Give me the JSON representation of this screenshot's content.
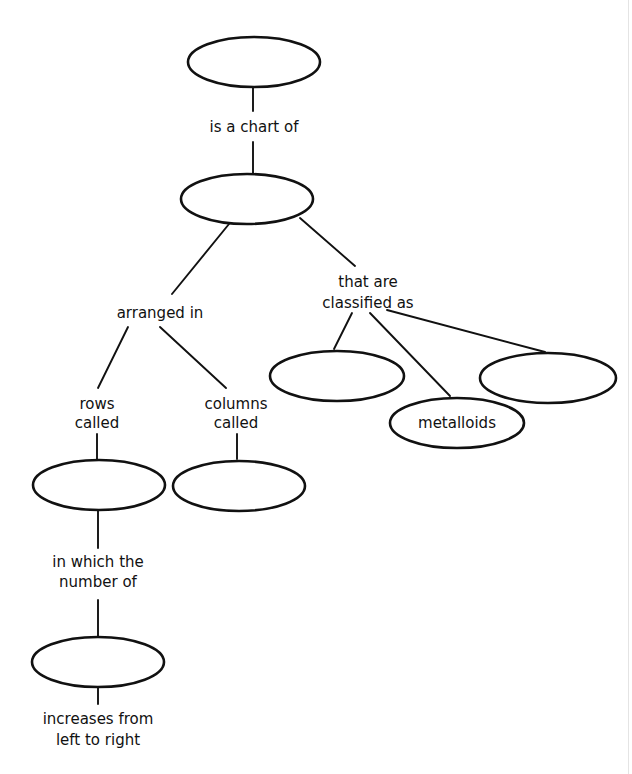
{
  "diagram": {
    "type": "concept-map",
    "nodes": {
      "root": {
        "label": ""
      },
      "periodic_table": {
        "label": ""
      },
      "class_left": {
        "label": ""
      },
      "metalloids": {
        "label": "metalloids"
      },
      "class_right": {
        "label": ""
      },
      "rows": {
        "label": ""
      },
      "columns": {
        "label": ""
      },
      "bottom": {
        "label": ""
      }
    },
    "linking_phrases": {
      "is_a_chart_of": "is a chart of",
      "arranged_in": "arranged in",
      "that_are_classified_as": [
        "that are",
        "classified as"
      ],
      "rows_called": [
        "rows",
        "called"
      ],
      "columns_called": [
        "columns",
        "called"
      ],
      "in_which_the_number_of": [
        "in which the",
        "number of"
      ],
      "increases_from_left_to_right": [
        "increases from",
        "left to right"
      ]
    },
    "colors": {
      "stroke": "#111111",
      "background": "#ffffff",
      "text": "#111111"
    }
  }
}
